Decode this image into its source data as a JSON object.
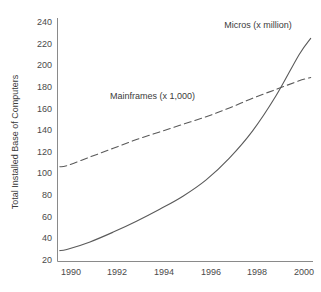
{
  "chart_data": {
    "type": "line",
    "title": "",
    "subtitle": "",
    "xlabel": "",
    "ylabel": "Total Installed Base of Computers",
    "xlim": [
      1989.6,
      2000.6
    ],
    "ylim": [
      20,
      240
    ],
    "grid": false,
    "legend_position": "inline-annotations",
    "x_tick_labels": [
      "1990",
      "1992",
      "1994",
      "1996",
      "1998",
      "2000"
    ],
    "x_ticks": [
      1990,
      1992,
      1994,
      1996,
      1998,
      2000
    ],
    "y_tick_labels": [
      "240",
      "220",
      "200",
      "180",
      "160",
      "140",
      "120",
      "100",
      "80",
      "60",
      "40",
      "20"
    ],
    "y_ticks": [
      240,
      220,
      200,
      180,
      160,
      140,
      120,
      100,
      80,
      60,
      40,
      20
    ],
    "x": [
      1989.7,
      1990,
      1991,
      1992,
      1993,
      1994,
      1995,
      1996,
      1997,
      1998,
      1999,
      2000,
      2000.5
    ],
    "series": [
      {
        "name": "Micros (x million)",
        "style": "solid",
        "color": "#5a5a5a",
        "label_text": "Micros (x million)",
        "values": [
          30,
          31,
          38,
          47,
          57,
          68,
          80,
          95,
          115,
          140,
          172,
          210,
          225
        ]
      },
      {
        "name": "Mainframes (x 1,000)",
        "style": "dashed",
        "color": "#5a5a5a",
        "label_text": "Mainframes (x 1,000)",
        "values": [
          107,
          108,
          116,
          124,
          132,
          139,
          146,
          153,
          161,
          170,
          178,
          186,
          189
        ]
      }
    ],
    "annotations": [
      {
        "text": "Micros (x million)",
        "x_px": 258,
        "y_px": 28
      },
      {
        "text": "Mainframes (x 1,000)",
        "x_px": 110,
        "y_px": 99
      }
    ]
  }
}
